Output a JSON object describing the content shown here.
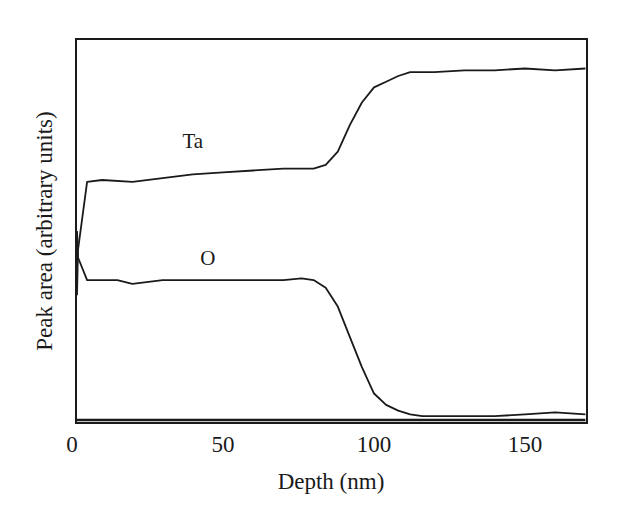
{
  "chart_data": {
    "type": "line",
    "title": "",
    "xlabel": "Depth (nm)",
    "ylabel": "Peak area (arbitrary units)",
    "xlim": [
      0,
      170
    ],
    "ylim": [
      0,
      1
    ],
    "x_ticks": [
      0,
      50,
      100,
      150
    ],
    "y_ticks": [],
    "grid": false,
    "legend": "none (inline curve labels)",
    "annotations": [
      {
        "text": "Ta",
        "x": 40,
        "y": 0.72
      },
      {
        "text": "O",
        "x": 45,
        "y": 0.41
      }
    ],
    "series": [
      {
        "name": "Ta",
        "x": [
          0,
          2,
          5,
          10,
          20,
          30,
          40,
          50,
          60,
          70,
          80,
          84,
          88,
          92,
          96,
          100,
          104,
          108,
          112,
          116,
          120,
          130,
          140,
          150,
          160,
          170
        ],
        "y": [
          0.33,
          0.45,
          0.63,
          0.635,
          0.63,
          0.64,
          0.65,
          0.655,
          0.66,
          0.665,
          0.665,
          0.675,
          0.71,
          0.78,
          0.84,
          0.88,
          0.895,
          0.91,
          0.92,
          0.92,
          0.92,
          0.925,
          0.925,
          0.93,
          0.925,
          0.93
        ]
      },
      {
        "name": "O",
        "x": [
          0,
          2,
          5,
          10,
          15,
          20,
          30,
          40,
          50,
          60,
          70,
          76,
          80,
          84,
          88,
          92,
          96,
          100,
          104,
          108,
          112,
          116,
          120,
          130,
          140,
          150,
          160,
          170
        ],
        "y": [
          0.5,
          0.43,
          0.37,
          0.37,
          0.37,
          0.36,
          0.37,
          0.37,
          0.37,
          0.37,
          0.37,
          0.375,
          0.37,
          0.35,
          0.3,
          0.22,
          0.14,
          0.07,
          0.04,
          0.025,
          0.015,
          0.01,
          0.01,
          0.01,
          0.01,
          0.015,
          0.02,
          0.015
        ]
      },
      {
        "name": "baseline",
        "x": [
          0,
          170
        ],
        "y": [
          0.0,
          0.0
        ]
      }
    ]
  }
}
